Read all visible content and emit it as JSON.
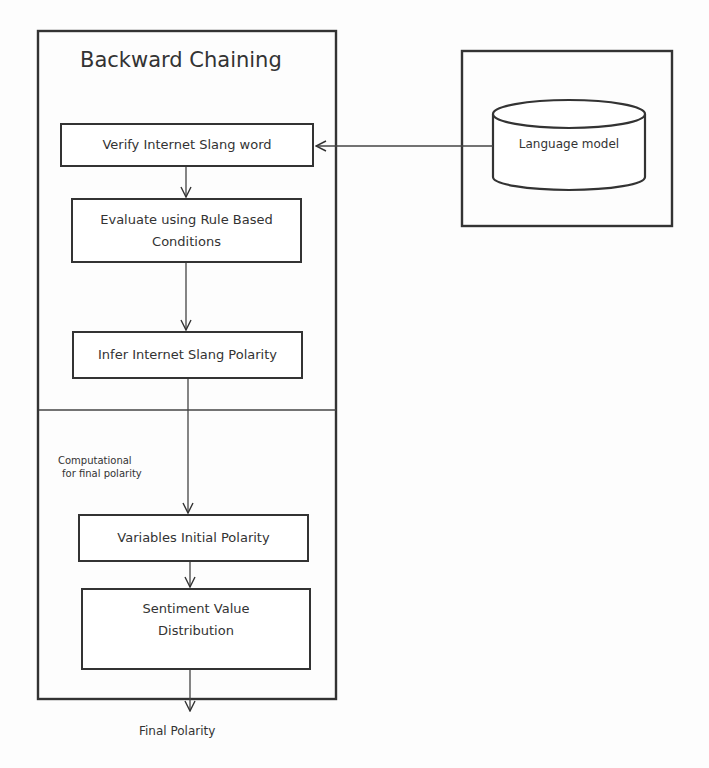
{
  "diagram": {
    "backward_chaining": {
      "title": "Backward Chaining",
      "steps": [
        {
          "id": "verify",
          "label": "Verify Internet Slang word"
        },
        {
          "id": "evaluate",
          "label": "Evaluate using Rule Based Conditions"
        },
        {
          "id": "infer",
          "label": "Infer Internet Slang Polarity"
        }
      ]
    },
    "computational": {
      "label_line1": "Computational",
      "label_line2": "for final polarity",
      "steps": [
        {
          "id": "variables",
          "label": "Variables Initial Polarity"
        },
        {
          "id": "sentiment",
          "label": "Sentiment Value Distribution"
        }
      ]
    },
    "language_model": {
      "label": "Language model"
    },
    "output": {
      "label": "Final Polarity"
    },
    "edges": [
      {
        "from": "language_model",
        "to": "verify"
      },
      {
        "from": "verify",
        "to": "evaluate"
      },
      {
        "from": "evaluate",
        "to": "infer"
      },
      {
        "from": "infer",
        "to": "variables"
      },
      {
        "from": "variables",
        "to": "sentiment"
      },
      {
        "from": "sentiment",
        "to": "output"
      }
    ]
  }
}
